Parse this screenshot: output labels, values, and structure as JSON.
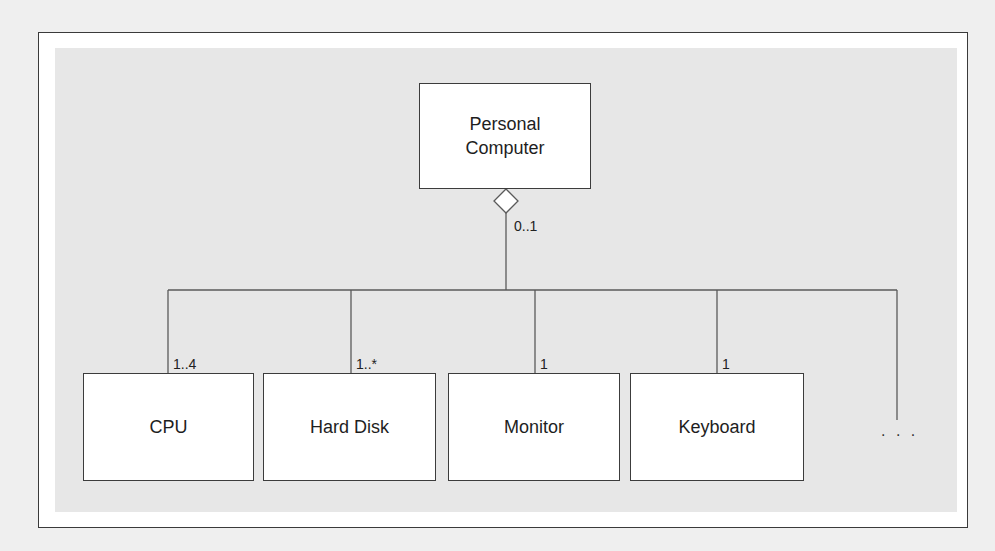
{
  "diagram": {
    "type": "UML aggregation",
    "whole": {
      "name": "Personal Computer",
      "line1": "Personal",
      "line2": "Computer",
      "multiplicity": "0..1",
      "aggregation_symbol": "hollow-diamond"
    },
    "parts": [
      {
        "name": "CPU",
        "multiplicity": "1..4"
      },
      {
        "name": "Hard Disk",
        "multiplicity": "1..*"
      },
      {
        "name": "Monitor",
        "multiplicity": "1"
      },
      {
        "name": "Keyboard",
        "multiplicity": "1"
      }
    ],
    "more_parts_indicator": ". . .",
    "colors": {
      "background": "#efefef",
      "frame": "#ffffff",
      "panel": "#e7e7e7",
      "lines": "#555555",
      "box_fill": "#ffffff"
    }
  }
}
